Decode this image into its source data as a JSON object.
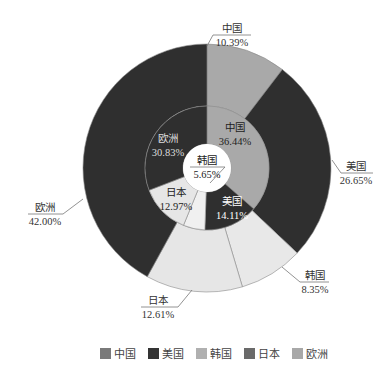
{
  "chart_data": {
    "type": "pie",
    "subtype": "nested-donut",
    "title": "",
    "legend": {
      "position": "bottom",
      "entries": [
        {
          "label": "中国",
          "color": "#7a7a7a"
        },
        {
          "label": "美国",
          "color": "#333333"
        },
        {
          "label": "韩国",
          "color": "#b0b0b0"
        },
        {
          "label": "日本",
          "color": "#6a6a6a"
        },
        {
          "label": "欧洲",
          "color": "#a8a8a8"
        }
      ]
    },
    "series": [
      {
        "name": "outer",
        "categories": [
          "中国",
          "美国",
          "韩国",
          "日本",
          "欧洲"
        ],
        "values": [
          10.39,
          26.65,
          8.35,
          12.61,
          42.0
        ],
        "labels": [
          "10.39%",
          "26.65%",
          "8.35%",
          "12.61%",
          "42.00%"
        ],
        "colors": [
          "#a9a9a9",
          "#2f2f2f",
          "#e8e8e8",
          "#e6e6e6",
          "#2f2f2f"
        ]
      },
      {
        "name": "inner",
        "categories": [
          "中国",
          "美国",
          "韩国",
          "日本",
          "欧洲"
        ],
        "values": [
          36.44,
          14.11,
          5.65,
          12.97,
          30.83
        ],
        "labels": [
          "36.44%",
          "14.11%",
          "5.65%",
          "12.97%",
          "30.83%"
        ],
        "colors": [
          "#a9a9a9",
          "#2f2f2f",
          "#f0f0f0",
          "#e6e6e6",
          "#2f2f2f"
        ]
      }
    ]
  },
  "outer_labels": [
    {
      "name": "中国",
      "value": "10.39%"
    },
    {
      "name": "美国",
      "value": "26.65%"
    },
    {
      "name": "韩国",
      "value": "8.35%"
    },
    {
      "name": "日本",
      "value": "12.61%"
    },
    {
      "name": "欧洲",
      "value": "42.00%"
    }
  ],
  "inner_labels": [
    {
      "name": "中国",
      "value": "36.44%"
    },
    {
      "name": "美国",
      "value": "14.11%"
    },
    {
      "name": "韩国",
      "value": "5.65%"
    },
    {
      "name": "日本",
      "value": "12.97%"
    },
    {
      "name": "欧洲",
      "value": "30.83%"
    }
  ]
}
